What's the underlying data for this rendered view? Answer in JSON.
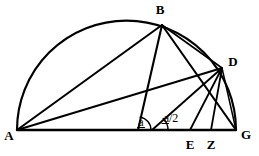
{
  "figure": {
    "width": 259,
    "height": 156,
    "background_color": "#ffffff",
    "ink_color": "#000000"
  },
  "labels": {
    "A": "A",
    "B": "B",
    "D": "D",
    "E": "E",
    "Z": "Z",
    "G": "G",
    "angle_a": "a",
    "angle_a_half": "a/2"
  },
  "points": {
    "A": {
      "x": 17,
      "y": 130,
      "label": "A",
      "label_x": 9,
      "label_y": 140
    },
    "B": {
      "x": 162,
      "y": 25,
      "label": "B",
      "label_x": 158,
      "label_y": 14
    },
    "D": {
      "x": 222,
      "y": 68,
      "label": "D",
      "label_x": 230,
      "label_y": 66
    },
    "E": {
      "x": 190,
      "y": 130,
      "label": "E",
      "label_x": 186,
      "label_y": 148
    },
    "Z": {
      "x": 211,
      "y": 130,
      "label": "Z",
      "label_x": 207,
      "label_y": 148
    },
    "G": {
      "x": 236,
      "y": 130,
      "label": "G",
      "label_x": 243,
      "label_y": 139
    },
    "V1": {
      "x": 138,
      "y": 130
    },
    "V2": {
      "x": 152,
      "y": 130
    }
  },
  "arc": {
    "center_x": 126.5,
    "center_y": 130,
    "radius": 109.5,
    "description": "semicircle on diameter AG"
  },
  "segments": [
    {
      "name": "baseline-AG",
      "from": "A",
      "to": "G"
    },
    {
      "name": "chord-AB",
      "from": "A",
      "to": "B"
    },
    {
      "name": "chord-AD",
      "from": "A",
      "to": "D"
    },
    {
      "name": "chord-BD",
      "from": "B",
      "to": "D"
    },
    {
      "name": "chord-BG",
      "from": "B",
      "to": "G"
    },
    {
      "name": "chord-BE",
      "from": "B",
      "to": "E"
    },
    {
      "name": "chord-DG",
      "from": "D",
      "to": "G"
    },
    {
      "name": "chord-DE",
      "from": "D",
      "to": "E"
    },
    {
      "name": "perpendicular-DZ",
      "from": "D",
      "to": "Z"
    },
    {
      "name": "ray-V2-D",
      "from": "V2",
      "to": "D"
    }
  ],
  "angle_arcs": [
    {
      "name": "angle-a-arc",
      "vertex": "V1",
      "label": "a",
      "label_x": 140,
      "label_y": 124,
      "radius": 13
    },
    {
      "name": "angle-a-half-arc",
      "vertex": "V2",
      "label": "a/2",
      "label_x": 167,
      "label_y": 120,
      "radius": 16
    }
  ]
}
